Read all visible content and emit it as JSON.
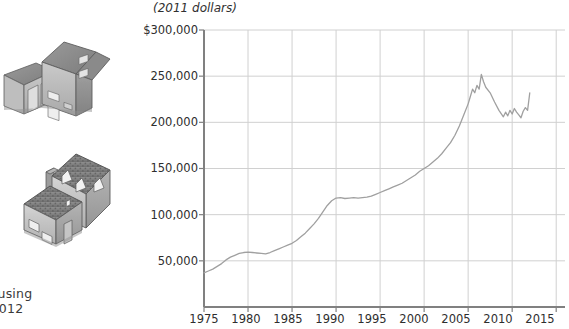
{
  "caption": {
    "line1": "lousing",
    "line2": "-2012"
  },
  "illustrations": [
    {
      "name": "modern-two-story-house-with-garage-illustration"
    },
    {
      "name": "traditional-cottage-house-illustration"
    }
  ],
  "chart_data": {
    "type": "line",
    "title": "",
    "subtitle": "",
    "unit_label": "(2011 dollars)",
    "xlabel": "",
    "ylabel": "",
    "grid": true,
    "legend": "none",
    "xlim": [
      1975,
      2016
    ],
    "ylim": [
      0,
      300000
    ],
    "x_ticks": [
      1975,
      1980,
      1985,
      1990,
      1995,
      2000,
      2005,
      2010,
      2015
    ],
    "x_tick_labels": [
      "1975",
      "1980",
      "1985",
      "1990",
      "1995",
      "2000",
      "2005",
      "2010",
      "2015"
    ],
    "y_ticks": [
      50000,
      100000,
      150000,
      200000,
      250000,
      300000
    ],
    "y_tick_labels": [
      "50,000",
      "100,000",
      "150,000",
      "200,000",
      "250,000",
      "$300,000"
    ],
    "line_color": "#a0a0a0",
    "grid_color": "#d0d0d0",
    "axis_color": "#808080",
    "series": [
      {
        "name": "Median housing price (2011 dollars)",
        "x": [
          1975.0,
          1975.5,
          1976.0,
          1976.5,
          1977.0,
          1977.5,
          1978.0,
          1978.5,
          1979.0,
          1979.5,
          1980.0,
          1980.5,
          1981.0,
          1981.5,
          1982.0,
          1982.5,
          1983.0,
          1983.5,
          1984.0,
          1984.5,
          1985.0,
          1985.5,
          1986.0,
          1986.5,
          1987.0,
          1987.5,
          1988.0,
          1988.5,
          1989.0,
          1989.5,
          1990.0,
          1990.5,
          1991.0,
          1991.5,
          1992.0,
          1992.5,
          1993.0,
          1993.5,
          1994.0,
          1994.5,
          1995.0,
          1995.5,
          1996.0,
          1996.5,
          1997.0,
          1997.5,
          1998.0,
          1998.5,
          1999.0,
          1999.5,
          2000.0,
          2000.5,
          2001.0,
          2001.5,
          2002.0,
          2002.5,
          2003.0,
          2003.5,
          2004.0,
          2004.5,
          2005.0,
          2005.25,
          2005.5,
          2005.75,
          2006.0,
          2006.25,
          2006.5,
          2006.75,
          2007.0,
          2007.5,
          2008.0,
          2008.5,
          2009.0,
          2009.25,
          2009.5,
          2009.75,
          2010.0,
          2010.25,
          2010.5,
          2010.75,
          2011.0,
          2011.25,
          2011.5,
          2011.75,
          2012.0
        ],
        "y": [
          37000,
          39000,
          41000,
          44000,
          47000,
          51000,
          54000,
          56000,
          58000,
          59000,
          59500,
          59000,
          58500,
          58000,
          57500,
          59000,
          61000,
          63000,
          65000,
          67000,
          69000,
          72000,
          76000,
          80000,
          85000,
          90000,
          96000,
          103000,
          110000,
          115000,
          118000,
          118500,
          117500,
          118000,
          118500,
          118000,
          118500,
          119000,
          120000,
          122000,
          124000,
          126000,
          128000,
          130000,
          132000,
          134000,
          137000,
          140000,
          143000,
          147000,
          150000,
          153000,
          157000,
          161000,
          166000,
          172000,
          178000,
          186000,
          196000,
          208000,
          220000,
          228000,
          236000,
          232000,
          240000,
          236000,
          252000,
          244000,
          238000,
          232000,
          222000,
          213000,
          206000,
          211000,
          207000,
          213000,
          209000,
          215000,
          211000,
          208000,
          205000,
          212000,
          216000,
          213000,
          232000
        ]
      }
    ]
  }
}
